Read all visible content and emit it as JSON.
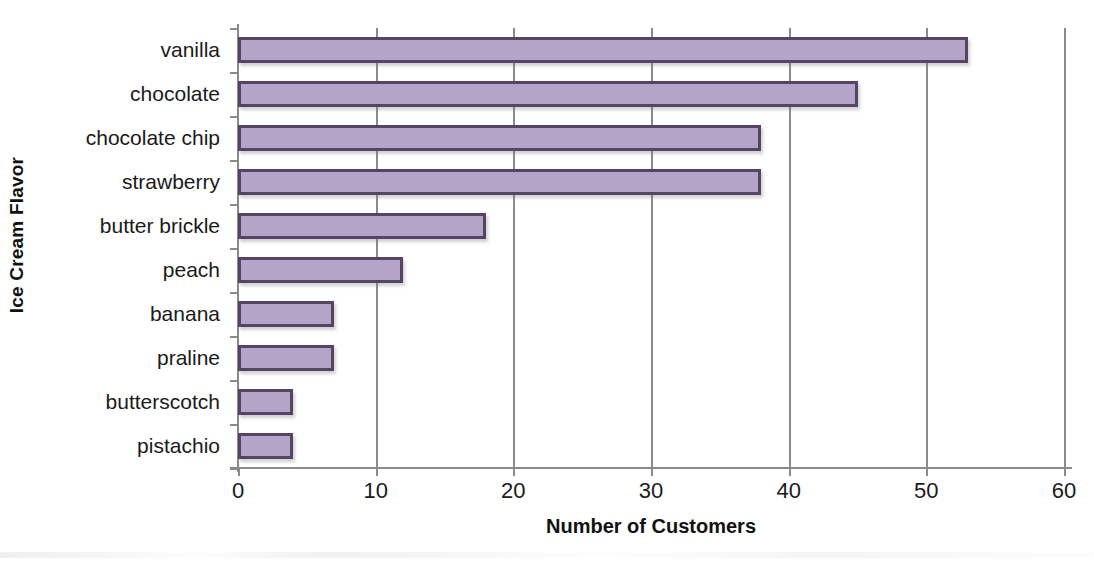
{
  "chart_data": {
    "type": "bar",
    "orientation": "horizontal",
    "title": "",
    "xlabel": "Number of Customers",
    "ylabel": "Ice Cream Flavor",
    "categories": [
      "vanilla",
      "chocolate",
      "chocolate chip",
      "strawberry",
      "butter brickle",
      "peach",
      "banana",
      "praline",
      "butterscotch",
      "pistachio"
    ],
    "values": [
      53,
      45,
      38,
      38,
      18,
      12,
      7,
      7,
      4,
      4
    ],
    "xlim": [
      0,
      60
    ],
    "xticks": [
      0,
      10,
      20,
      30,
      40,
      50,
      60
    ],
    "xtick_labels": [
      "0",
      "10",
      "20",
      "30",
      "40",
      "50",
      "60"
    ],
    "grid": "vertical",
    "legend": "none",
    "bar_fill_color": "#b3a4c8",
    "bar_border_color": "#554463",
    "axis_color": "#8a8a8a"
  }
}
